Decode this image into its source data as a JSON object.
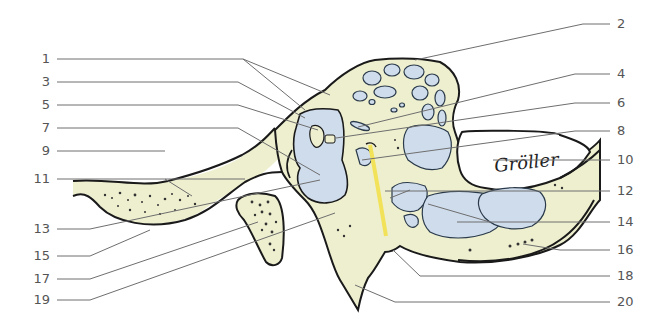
{
  "diagram": {
    "type": "anatomical cross-section illustration with numbered leader-line labels",
    "colors": {
      "bone": "#eeefcf",
      "air_cells": "#cfdcec",
      "outline": "#1a1a1a",
      "nerve_yellow": "#f2e25a",
      "leader_line": "#6e6e6e",
      "label_text": "#555555",
      "background": "#ffffff"
    },
    "signature": "Gröller",
    "labels_left": [
      {
        "number": "1",
        "y": 59
      },
      {
        "number": "3",
        "y": 82
      },
      {
        "number": "5",
        "y": 105
      },
      {
        "number": "7",
        "y": 128
      },
      {
        "number": "9",
        "y": 151
      },
      {
        "number": "11",
        "y": 179
      },
      {
        "number": "13",
        "y": 229
      },
      {
        "number": "15",
        "y": 256
      },
      {
        "number": "17",
        "y": 279
      },
      {
        "number": "19",
        "y": 300
      }
    ],
    "labels_right": [
      {
        "number": "2",
        "y": 24
      },
      {
        "number": "4",
        "y": 74
      },
      {
        "number": "6",
        "y": 103
      },
      {
        "number": "8",
        "y": 131
      },
      {
        "number": "10",
        "y": 160
      },
      {
        "number": "12",
        "y": 191
      },
      {
        "number": "14",
        "y": 222
      },
      {
        "number": "16",
        "y": 250
      },
      {
        "number": "18",
        "y": 276
      },
      {
        "number": "20",
        "y": 302
      }
    ]
  }
}
